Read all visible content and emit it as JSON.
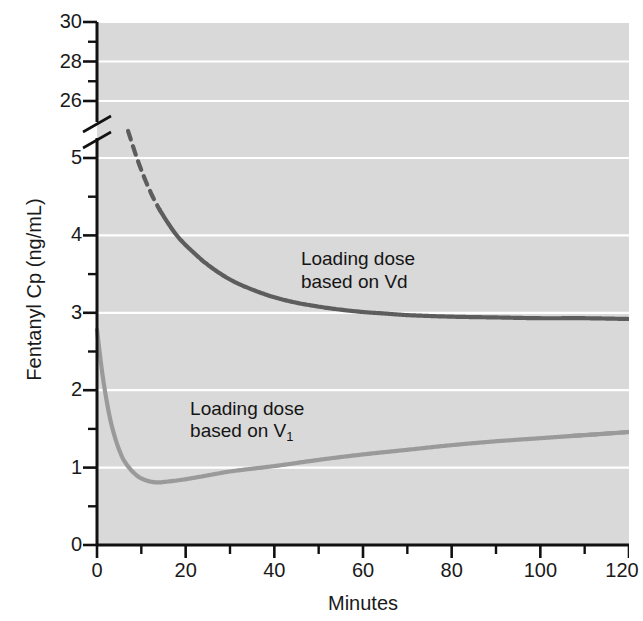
{
  "chart_data": {
    "type": "line",
    "title": "",
    "xlabel": "Minutes",
    "ylabel": "Fentanyl Cp (ng/mL)",
    "xlim": [
      0,
      120
    ],
    "ylim": [
      0,
      30
    ],
    "grid": true,
    "axis_break": {
      "between": [
        5.5,
        25.5
      ],
      "note": "y-axis broken between 26 and 5"
    },
    "xticks": [
      0,
      20,
      40,
      60,
      80,
      100,
      120
    ],
    "xtick_labels": [
      "0",
      "20",
      "40",
      "60",
      "80",
      "100",
      "120"
    ],
    "xminor_ticks": [
      10,
      30,
      50,
      70,
      90,
      110
    ],
    "yticks_upper": [
      26,
      28,
      30
    ],
    "ytick_labels_upper": [
      "26",
      "28",
      "30"
    ],
    "yticks_lower": [
      0,
      1,
      2,
      3,
      4,
      5
    ],
    "ytick_labels_lower": [
      "0",
      "1",
      "2",
      "3",
      "4",
      "5"
    ],
    "yminor_ticks_lower": [
      0.5,
      1.5,
      2.5,
      3.5,
      4.5
    ],
    "legend_position": "inline-annotations",
    "series": [
      {
        "name": "Loading dose based on Vd",
        "color": "#5d5d5d",
        "style": "solid-with-dashed-extrapolation",
        "dashed_range_minutes": [
          7,
          14
        ],
        "x": [
          7,
          9,
          11,
          13,
          15,
          18,
          21,
          25,
          30,
          35,
          40,
          45,
          50,
          55,
          60,
          65,
          70,
          80,
          90,
          100,
          110,
          120
        ],
        "y": [
          5.35,
          5.0,
          4.7,
          4.45,
          4.25,
          4.0,
          3.82,
          3.62,
          3.43,
          3.3,
          3.2,
          3.13,
          3.08,
          3.04,
          3.01,
          2.99,
          2.97,
          2.95,
          2.94,
          2.93,
          2.93,
          2.92
        ],
        "asymptote": 2.92,
        "annotation": {
          "line1": "Loading dose",
          "line2": "based on Vd",
          "x_minutes": 46,
          "y_value": 3.55
        }
      },
      {
        "name": "Loading dose based on V1",
        "color": "#9a9a9a",
        "style": "solid-with-dashed-extrapolation",
        "dashed_range_minutes": [
          107,
          120
        ],
        "x": [
          0,
          1,
          2,
          3,
          4,
          5,
          6,
          8,
          10,
          13,
          16,
          20,
          25,
          30,
          40,
          50,
          60,
          70,
          80,
          90,
          100,
          110,
          120
        ],
        "y": [
          2.78,
          2.3,
          1.92,
          1.62,
          1.4,
          1.23,
          1.1,
          0.95,
          0.86,
          0.81,
          0.82,
          0.85,
          0.9,
          0.95,
          1.02,
          1.1,
          1.17,
          1.23,
          1.29,
          1.34,
          1.38,
          1.42,
          1.46
        ],
        "nadir": {
          "x_minutes": 13,
          "y_value": 0.81
        },
        "annotation": {
          "line1": "Loading dose",
          "line2_prefix": "based on V",
          "line2_sub": "1",
          "x_minutes": 21,
          "y_value": 1.62
        }
      }
    ]
  },
  "colors": {
    "plot_background": "#d9d9d9",
    "gridline": "#ffffff",
    "axis": "#111111",
    "dark_curve": "#5d5d5d",
    "light_curve": "#9a9a9a",
    "text": "#1a1a1a"
  }
}
